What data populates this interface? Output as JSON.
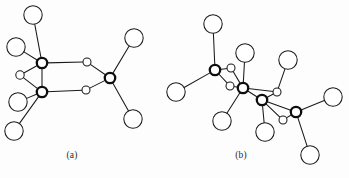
{
  "figure": {
    "background_color": "#fdfdfd",
    "line_color": "#1a1a1a",
    "atom_fill_color": "#ffffff",
    "width": 349,
    "height": 178
  },
  "panels": [
    {
      "id": "a",
      "label": "(a)",
      "label_x": 72,
      "label_y": 158,
      "description": "Edge-sharing dimer: two bold metal centers bridged by two small atoms, each terminal ligand drawn as a large open circle",
      "atoms": [
        {
          "name": "metal-1",
          "type": "bold",
          "x": 42,
          "y": 63,
          "r": 5.2
        },
        {
          "name": "metal-2",
          "type": "bold",
          "x": 42,
          "y": 92,
          "r": 5.2
        },
        {
          "name": "metal-3",
          "type": "bold",
          "x": 110,
          "y": 78,
          "r": 5.2
        },
        {
          "name": "bridge-1",
          "type": "small",
          "x": 87,
          "y": 62,
          "r": 4.0
        },
        {
          "name": "bridge-2",
          "type": "small",
          "x": 86,
          "y": 90,
          "r": 4.0
        },
        {
          "name": "bridge-3",
          "type": "small",
          "x": 20,
          "y": 75,
          "r": 4.2
        },
        {
          "name": "ligand-1",
          "type": "large",
          "x": 33,
          "y": 15,
          "r": 9.2
        },
        {
          "name": "ligand-2",
          "type": "large",
          "x": 16,
          "y": 47,
          "r": 9.2
        },
        {
          "name": "ligand-3",
          "type": "large",
          "x": 18,
          "y": 102,
          "r": 9.2
        },
        {
          "name": "ligand-4",
          "type": "large",
          "x": 14,
          "y": 131,
          "r": 9.2
        },
        {
          "name": "ligand-5",
          "type": "large",
          "x": 134,
          "y": 38,
          "r": 9.2
        },
        {
          "name": "ligand-6",
          "type": "large",
          "x": 133,
          "y": 119,
          "r": 9.2
        }
      ],
      "bonds": [
        {
          "from": "metal-1",
          "to": "bridge-1"
        },
        {
          "from": "bridge-1",
          "to": "metal-3"
        },
        {
          "from": "metal-2",
          "to": "bridge-2"
        },
        {
          "from": "bridge-2",
          "to": "metal-3"
        },
        {
          "from": "metal-1",
          "to": "ligand-1"
        },
        {
          "from": "metal-1",
          "to": "ligand-2"
        },
        {
          "from": "metal-1",
          "to": "bridge-3"
        },
        {
          "from": "metal-2",
          "to": "bridge-3"
        },
        {
          "from": "metal-2",
          "to": "ligand-3"
        },
        {
          "from": "metal-2",
          "to": "ligand-4"
        },
        {
          "from": "metal-2",
          "to": "metal-1"
        },
        {
          "from": "metal-3",
          "to": "ligand-5"
        },
        {
          "from": "metal-3",
          "to": "ligand-6"
        }
      ]
    },
    {
      "id": "b",
      "label": "(b)",
      "label_x": 241,
      "label_y": 158,
      "description": "Chain of four bold metal centers linked by small bridging atoms, with large open-circle terminal ligands",
      "atoms": [
        {
          "name": "metal-1",
          "type": "bold",
          "x": 215,
          "y": 70,
          "r": 5.2
        },
        {
          "name": "metal-2",
          "type": "bold",
          "x": 243,
          "y": 88,
          "r": 5.2
        },
        {
          "name": "metal-3",
          "type": "bold",
          "x": 262,
          "y": 100,
          "r": 5.2
        },
        {
          "name": "metal-4",
          "type": "bold",
          "x": 296,
          "y": 112,
          "r": 5.2
        },
        {
          "name": "bridge-1",
          "type": "small",
          "x": 231,
          "y": 68,
          "r": 4.0
        },
        {
          "name": "bridge-2",
          "type": "small",
          "x": 230,
          "y": 86,
          "r": 4.0
        },
        {
          "name": "bridge-3",
          "type": "small",
          "x": 277,
          "y": 92,
          "r": 4.0
        },
        {
          "name": "bridge-4",
          "type": "small",
          "x": 283,
          "y": 120,
          "r": 4.0
        },
        {
          "name": "ligand-1",
          "type": "large",
          "x": 213,
          "y": 24,
          "r": 9.2
        },
        {
          "name": "ligand-2",
          "type": "large",
          "x": 176,
          "y": 92,
          "r": 9.2
        },
        {
          "name": "ligand-3",
          "type": "large",
          "x": 245,
          "y": 53,
          "r": 9.2
        },
        {
          "name": "ligand-4",
          "type": "large",
          "x": 288,
          "y": 60,
          "r": 9.2
        },
        {
          "name": "ligand-5",
          "type": "large",
          "x": 222,
          "y": 121,
          "r": 9.2
        },
        {
          "name": "ligand-6",
          "type": "large",
          "x": 265,
          "y": 132,
          "r": 9.2
        },
        {
          "name": "ligand-7",
          "type": "large",
          "x": 333,
          "y": 97,
          "r": 9.2
        },
        {
          "name": "ligand-8",
          "type": "large",
          "x": 310,
          "y": 155,
          "r": 9.2
        }
      ],
      "bonds": [
        {
          "from": "metal-1",
          "to": "bridge-1"
        },
        {
          "from": "bridge-1",
          "to": "metal-2"
        },
        {
          "from": "metal-1",
          "to": "bridge-2"
        },
        {
          "from": "bridge-2",
          "to": "metal-2"
        },
        {
          "from": "metal-2",
          "to": "metal-3"
        },
        {
          "from": "metal-3",
          "to": "bridge-3"
        },
        {
          "from": "bridge-3",
          "to": "metal-2"
        },
        {
          "from": "metal-3",
          "to": "bridge-4"
        },
        {
          "from": "bridge-4",
          "to": "metal-4"
        },
        {
          "from": "metal-3",
          "to": "metal-4"
        },
        {
          "from": "metal-1",
          "to": "ligand-1"
        },
        {
          "from": "metal-1",
          "to": "ligand-2"
        },
        {
          "from": "metal-2",
          "to": "ligand-3"
        },
        {
          "from": "bridge-3",
          "to": "ligand-4"
        },
        {
          "from": "metal-2",
          "to": "ligand-5"
        },
        {
          "from": "metal-3",
          "to": "ligand-6"
        },
        {
          "from": "metal-4",
          "to": "ligand-7"
        },
        {
          "from": "metal-4",
          "to": "ligand-8"
        }
      ]
    }
  ]
}
